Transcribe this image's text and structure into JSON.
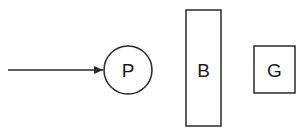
{
  "canvas": {
    "width": 307,
    "height": 136,
    "background_color": "#ffffff",
    "stroke_color": "#2b2b2b",
    "label_color": "#1a1a1a"
  },
  "diagram": {
    "type": "schematic-line-diagram",
    "arrow": {
      "name": "incoming-ray-arrow",
      "x1": 8,
      "y1": 70,
      "x2": 103,
      "y2": 70,
      "head_points": "103,70 94,66 94,74",
      "direction": "right"
    },
    "shapes": [
      {
        "id": "p",
        "kind": "circle",
        "label": "P",
        "cx": 128,
        "cy": 70,
        "r": 24,
        "label_x": 128,
        "label_y": 70
      },
      {
        "id": "b",
        "kind": "rect",
        "label": "B",
        "x": 186,
        "y": 10,
        "width": 35,
        "height": 116,
        "label_x": 203.5,
        "label_y": 70
      },
      {
        "id": "g",
        "kind": "rect",
        "label": "G",
        "x": 254,
        "y": 46,
        "width": 41,
        "height": 47,
        "label_x": 274.5,
        "label_y": 70
      }
    ]
  }
}
